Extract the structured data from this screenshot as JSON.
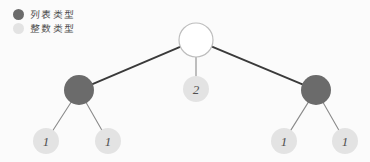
{
  "diagram": {
    "background_color": "#fbfbfb",
    "legend": {
      "items": [
        {
          "label": "列表类型",
          "color": "#6b6b6b",
          "swatch_name": "list-type-swatch"
        },
        {
          "label": "整数类型",
          "color": "#e3e3e3",
          "swatch_name": "integer-type-swatch"
        }
      ]
    },
    "colors": {
      "list_node_fill": "#6b6b6b",
      "integer_node_fill": "#e3e3e3",
      "root_node_fill": "#ffffff",
      "root_node_stroke": "#bdbdbd",
      "edge_thick": "#3a3a3a",
      "edge_thin": "#8a8a8a",
      "label_text": "#4f4f4f"
    },
    "nodes": [
      {
        "id": "root",
        "name": "root-node",
        "label": "",
        "type": "list",
        "cx": 196,
        "cy": 40,
        "r": 17,
        "style": "hollow"
      },
      {
        "id": "l1",
        "name": "left-list-node",
        "label": "",
        "type": "list",
        "cx": 79,
        "cy": 90,
        "r": 15,
        "style": "filled-dark"
      },
      {
        "id": "m1",
        "name": "middle-int-node",
        "label": "2",
        "type": "integer",
        "cx": 196,
        "cy": 89,
        "r": 13,
        "style": "filled-light"
      },
      {
        "id": "r1",
        "name": "right-list-node",
        "label": "",
        "type": "list",
        "cx": 316,
        "cy": 90,
        "r": 15,
        "style": "filled-dark"
      },
      {
        "id": "l1a",
        "name": "leaf-node-1",
        "label": "1",
        "type": "integer",
        "cx": 46,
        "cy": 141,
        "r": 13,
        "style": "filled-light"
      },
      {
        "id": "l1b",
        "name": "leaf-node-2",
        "label": "1",
        "type": "integer",
        "cx": 108,
        "cy": 141,
        "r": 13,
        "style": "filled-light"
      },
      {
        "id": "r1a",
        "name": "leaf-node-3",
        "label": "1",
        "type": "integer",
        "cx": 284,
        "cy": 141,
        "r": 13,
        "style": "filled-light"
      },
      {
        "id": "r1b",
        "name": "leaf-node-4",
        "label": "1",
        "type": "integer",
        "cx": 345,
        "cy": 141,
        "r": 13,
        "style": "filled-light"
      }
    ],
    "edges": [
      {
        "name": "edge-root-to-left",
        "from": "root",
        "to": "l1",
        "weight": "thick"
      },
      {
        "name": "edge-root-to-middle",
        "from": "root",
        "to": "m1",
        "weight": "thin"
      },
      {
        "name": "edge-root-to-right",
        "from": "root",
        "to": "r1",
        "weight": "thick"
      },
      {
        "name": "edge-left-to-leaf-1",
        "from": "l1",
        "to": "l1a",
        "weight": "thin"
      },
      {
        "name": "edge-left-to-leaf-2",
        "from": "l1",
        "to": "l1b",
        "weight": "thin"
      },
      {
        "name": "edge-right-to-leaf-3",
        "from": "r1",
        "to": "r1a",
        "weight": "thin"
      },
      {
        "name": "edge-right-to-leaf-4",
        "from": "r1",
        "to": "r1b",
        "weight": "thin"
      }
    ]
  }
}
